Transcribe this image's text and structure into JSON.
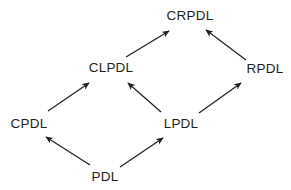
{
  "diagram": {
    "type": "directed-graph",
    "title": "",
    "background_color": "#ffffff",
    "text_color": "#231f20",
    "edge_color": "#231f20",
    "nodes": [
      {
        "id": "CRPDL",
        "label": "CRPDL",
        "x": 190,
        "y": 16
      },
      {
        "id": "CLPDL",
        "label": "CLPDL",
        "x": 111,
        "y": 68
      },
      {
        "id": "RPDL",
        "label": "RPDL",
        "x": 265,
        "y": 69
      },
      {
        "id": "CPDL",
        "label": "CPDL",
        "x": 29,
        "y": 124
      },
      {
        "id": "LPDL",
        "label": "LPDL",
        "x": 181,
        "y": 124
      },
      {
        "id": "PDL",
        "label": "PDL",
        "x": 105,
        "y": 177
      }
    ],
    "edges": [
      {
        "from": "CLPDL",
        "to": "CRPDL",
        "x1": 126,
        "y1": 57,
        "x2": 169,
        "y2": 31
      },
      {
        "from": "RPDL",
        "to": "CRPDL",
        "x1": 246,
        "y1": 60,
        "x2": 206,
        "y2": 30
      },
      {
        "from": "CPDL",
        "to": "CLPDL",
        "x1": 48,
        "y1": 111,
        "x2": 89,
        "y2": 83
      },
      {
        "from": "LPDL",
        "to": "CLPDL",
        "x1": 161,
        "y1": 112,
        "x2": 128,
        "y2": 83
      },
      {
        "from": "LPDL",
        "to": "RPDL",
        "x1": 199,
        "y1": 113,
        "x2": 241,
        "y2": 83
      },
      {
        "from": "PDL",
        "to": "CPDL",
        "x1": 90,
        "y1": 165,
        "x2": 46,
        "y2": 137
      },
      {
        "from": "PDL",
        "to": "LPDL",
        "x1": 120,
        "y1": 167,
        "x2": 163,
        "y2": 138
      }
    ]
  }
}
